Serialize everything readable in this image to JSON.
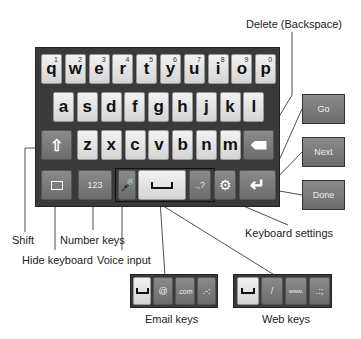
{
  "keyboard": {
    "row1": [
      {
        "char": "q",
        "num": "1"
      },
      {
        "char": "w",
        "num": "2"
      },
      {
        "char": "e",
        "num": "3"
      },
      {
        "char": "r",
        "num": "4"
      },
      {
        "char": "t",
        "num": "5"
      },
      {
        "char": "y",
        "num": "6"
      },
      {
        "char": "u",
        "num": "7"
      },
      {
        "char": "i",
        "num": "8"
      },
      {
        "char": "o",
        "num": "9"
      },
      {
        "char": "p",
        "num": "0"
      }
    ],
    "row2": [
      "a",
      "s",
      "d",
      "f",
      "g",
      "h",
      "j",
      "k",
      "l"
    ],
    "row3": [
      "z",
      "x",
      "c",
      "v",
      "b",
      "n",
      "m"
    ],
    "row4": {
      "number_key": "123",
      "punct_key": ".,?"
    }
  },
  "action_buttons": [
    "Go",
    "Next",
    "Done"
  ],
  "email_keys": {
    "at": "@",
    "com": ".com",
    "punct": ".-:"
  },
  "web_keys": {
    "slash": "/",
    "www": "www.",
    "punct": ".:;"
  },
  "labels": {
    "delete": "Delete (Backspace)",
    "shift": "Shift",
    "hide_keyboard": "Hide keyboard",
    "number_keys": "Number keys",
    "voice_input": "Voice input",
    "keyboard_settings": "Keyboard settings",
    "email_keys": "Email keys",
    "web_keys": "Web keys"
  },
  "icons": {
    "shift": "arrow-up-icon",
    "delete": "backspace-icon",
    "hide": "keyboard-hide-icon",
    "mic": "microphone-icon",
    "space": "space-bar-icon",
    "settings": "gear-icon",
    "enter": "enter-icon"
  }
}
